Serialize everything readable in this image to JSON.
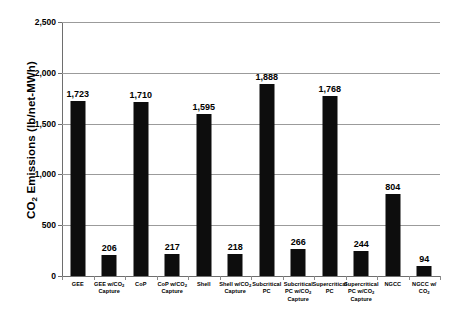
{
  "chart_data": {
    "type": "bar",
    "title": "",
    "xlabel": "",
    "ylabel": "CO2 Emissions (lb/net-MWh)",
    "ylabel_parts": {
      "prefix": "CO",
      "sub": "2",
      "suffix": " Emissions (lb/net-MWh)"
    },
    "ylim": [
      0,
      2500
    ],
    "yticks": [
      0,
      500,
      1000,
      1500,
      2000,
      2500
    ],
    "ytick_labels": [
      "0",
      "500",
      "1,000",
      "1,500",
      "2,000",
      "2,500"
    ],
    "grid": true,
    "legend": null,
    "bar_color": "#0d0d0d",
    "gridline_color": "#9b9b9b",
    "background_color": "#ffffff",
    "categories": [
      "GEE",
      "GEE w/CO2 Capture",
      "CoP",
      "CoP w/CO2 Capture",
      "Shell",
      "Shell w/CO2 Capture",
      "Subcritical PC",
      "Subcritical PC w/CO2 Capture",
      "Supercritical PC",
      "Supercritical PC w/CO2 Capture",
      "NGCC",
      "NGCC w/ CO2 Capture"
    ],
    "category_lines": [
      [
        "GEE"
      ],
      [
        "GEE w/CO",
        "Capture"
      ],
      [
        "CoP"
      ],
      [
        "CoP w/CO",
        "Capture"
      ],
      [
        "Shell"
      ],
      [
        "Shell w/CO",
        "Capture"
      ],
      [
        "Subcritical",
        "PC"
      ],
      [
        "Subcritical",
        "PC w/CO",
        "Capture"
      ],
      [
        "Supercritical",
        "PC"
      ],
      [
        "Supercritical",
        "PC w/CO",
        "Capture"
      ],
      [
        "NGCC"
      ],
      [
        "NGCC w/",
        "CO",
        "Capture"
      ]
    ],
    "values": [
      1723,
      206,
      1710,
      217,
      1595,
      218,
      1888,
      266,
      1768,
      244,
      804,
      94
    ],
    "value_labels": [
      "1,723",
      "206",
      "1,710",
      "217",
      "1,595",
      "218",
      "1,888",
      "266",
      "1,768",
      "244",
      "804",
      "94"
    ]
  }
}
